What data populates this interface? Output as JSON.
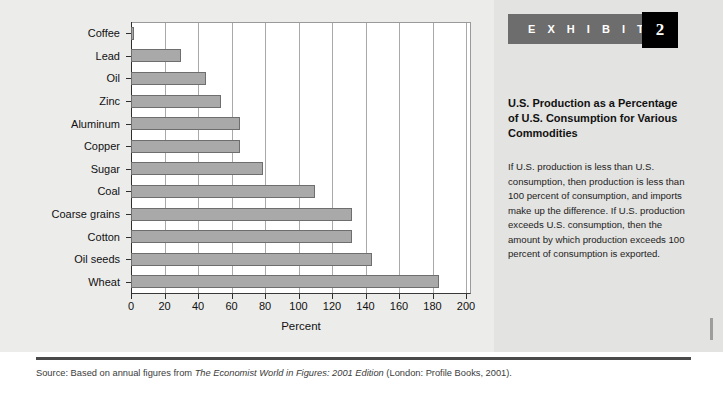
{
  "chart_data": {
    "type": "bar",
    "orientation": "horizontal",
    "title": "",
    "xlabel": "Percent",
    "ylabel": "",
    "xlim": [
      0,
      200
    ],
    "xticks": [
      0,
      20,
      40,
      60,
      80,
      100,
      120,
      140,
      160,
      180,
      200
    ],
    "xtick_labels": [
      "0",
      "20",
      "40",
      "60",
      "80",
      "100",
      "120",
      "140",
      "160",
      "180",
      "200"
    ],
    "grid": "vertical",
    "legend": "none",
    "bar_color": "#a9a9a9",
    "bar_edge_color": "#6e6e6e",
    "categories": [
      "Coffee",
      "Lead",
      "Oil",
      "Zinc",
      "Aluminum",
      "Copper",
      "Sugar",
      "Coal",
      "Coarse grains",
      "Cotton",
      "Oil seeds",
      "Wheat"
    ],
    "values": [
      2,
      30,
      45,
      54,
      65,
      65,
      79,
      110,
      132,
      132,
      144,
      184
    ]
  },
  "figure": {
    "axis_title": "Percent"
  },
  "exhibit": {
    "banner_label": "E X H I B I T",
    "number": "2",
    "title": "U.S. Production as a Percentage of U.S. Consumption for Various Commodities",
    "body": "If U.S. production is less than U.S. consumption, then production is less than 100 percent of consumption, and imports make up the difference. If U.S. production exceeds U.S. consumption, then the amount by which production exceeds 100 percent of consumption is exported."
  },
  "source": {
    "prefix": "Source: Based on annual figures from ",
    "italic": "The Economist World in Figures: 2001 Edition",
    "suffix": " (London: Profile Books, 2001)."
  }
}
